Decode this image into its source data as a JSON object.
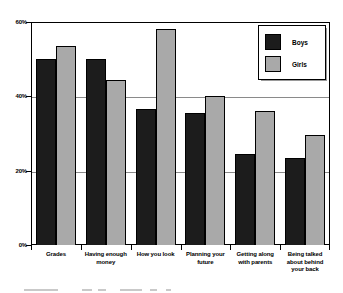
{
  "chart_data": {
    "type": "bar",
    "title": "",
    "xlabel": "",
    "ylabel": "",
    "ylim": [
      0,
      60
    ],
    "grid": true,
    "legend_position": "top-right",
    "categories": [
      "Grades",
      "Having enough money",
      "How you look",
      "Planning your future",
      "Getting along with parents",
      "Being talked about behind your back"
    ],
    "series": [
      {
        "name": "Boys",
        "color": "#1c1c1c",
        "values": [
          50,
          50,
          36.5,
          35.5,
          24.5,
          23.5
        ]
      },
      {
        "name": "Girls",
        "color": "#a9a9a9",
        "values": [
          53.5,
          44.5,
          58,
          40,
          36,
          29.5
        ]
      }
    ],
    "yticks": [
      "60%",
      "40%",
      "20%",
      "0%"
    ],
    "ytick_values": [
      60,
      40,
      20,
      0
    ]
  },
  "legend": {
    "items": [
      {
        "label": "Boys",
        "color": "#1c1c1c"
      },
      {
        "label": "Girls",
        "color": "#a9a9a9"
      }
    ]
  },
  "axis": {
    "y_labels": [
      "60%",
      "40%",
      "20%",
      "0%"
    ]
  },
  "categories": [
    {
      "line1": "Grades",
      "line2": "",
      "line3": ""
    },
    {
      "line1": "Having enough",
      "line2": "money",
      "line3": ""
    },
    {
      "line1": "How you look",
      "line2": "",
      "line3": ""
    },
    {
      "line1": "Planning your",
      "line2": "future",
      "line3": ""
    },
    {
      "line1": "Getting along",
      "line2": "with parents",
      "line3": ""
    },
    {
      "line1": "Being talked",
      "line2": "about behind",
      "line3": "your back"
    }
  ]
}
